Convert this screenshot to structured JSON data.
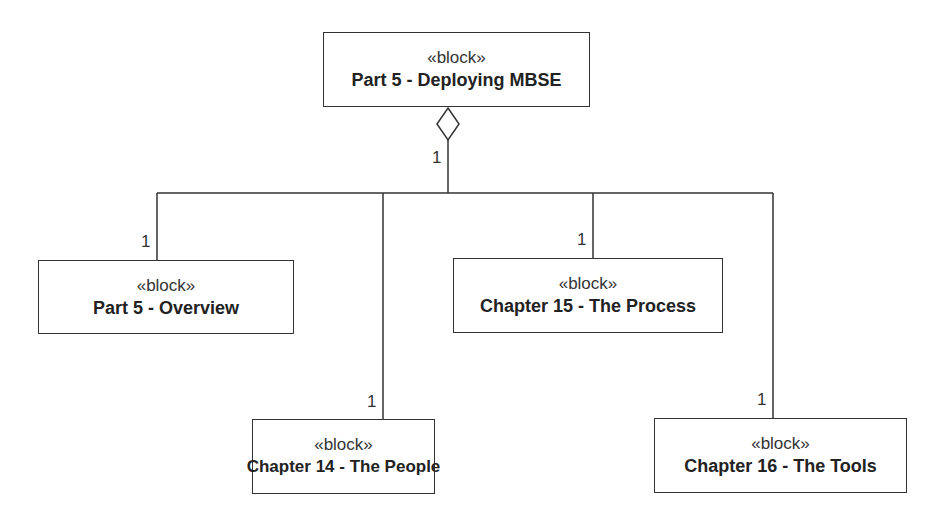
{
  "diagram": {
    "type": "SysML block definition (composition/aggregation)",
    "root": {
      "stereotype": "«block»",
      "name": "Part 5 - Deploying MBSE",
      "multiplicity": "1"
    },
    "children": [
      {
        "stereotype": "«block»",
        "name": "Part 5 - Overview",
        "multiplicity": "1"
      },
      {
        "stereotype": "«block»",
        "name": "Chapter 14 - The People",
        "multiplicity": "1"
      },
      {
        "stereotype": "«block»",
        "name": "Chapter 15 - The Process",
        "multiplicity": "1"
      },
      {
        "stereotype": "«block»",
        "name": "Chapter 16 - The Tools",
        "multiplicity": "1"
      }
    ],
    "line_color": "#333333"
  }
}
